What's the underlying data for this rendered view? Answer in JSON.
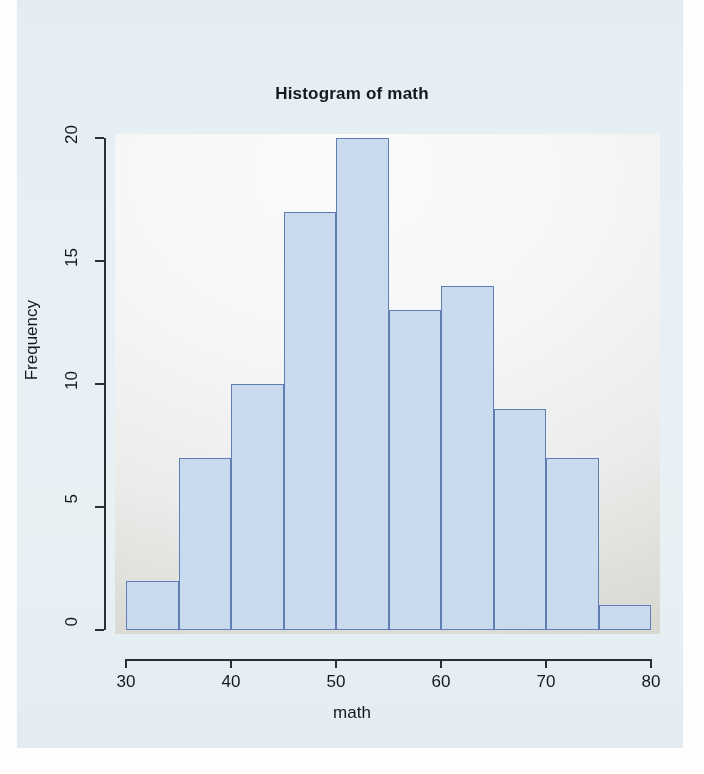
{
  "chart_data": {
    "type": "bar",
    "title": "Histogram of math",
    "xlabel": "math",
    "ylabel": "Frequency",
    "categories": [
      "30-35",
      "35-40",
      "40-45",
      "45-50",
      "50-55",
      "55-60",
      "60-65",
      "65-70",
      "70-75",
      "75-80"
    ],
    "bin_edges": [
      30,
      35,
      40,
      45,
      50,
      55,
      60,
      65,
      70,
      75,
      80
    ],
    "bin_width": 5,
    "values": [
      2,
      7,
      10,
      17,
      20,
      13,
      14,
      9,
      7,
      1
    ],
    "xlim": [
      30,
      80
    ],
    "ylim": [
      0,
      20
    ],
    "x_ticks": [
      30,
      40,
      50,
      60,
      70,
      80
    ],
    "y_ticks": [
      0,
      5,
      10,
      15,
      20
    ],
    "grid": false,
    "legend": null,
    "bar_fill_color": "#ccdcf0",
    "bar_border_color": "#5f7fb5",
    "axis_color": "#2b2f33",
    "canvas_color": "#e7f0f5",
    "panel_color": "#f7f8f8"
  }
}
